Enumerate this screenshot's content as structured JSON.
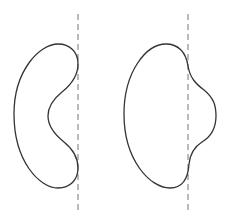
{
  "diagram": {
    "stroke_color": "#333333",
    "dash_color": "#777777",
    "figures": [
      {
        "name": "kidney-shape",
        "touches_axis": true,
        "region": "left of axis, concave toward axis"
      },
      {
        "name": "bulge-shape",
        "touches_axis": true,
        "region": "mostly left of axis with bulge crossing to right"
      }
    ]
  }
}
